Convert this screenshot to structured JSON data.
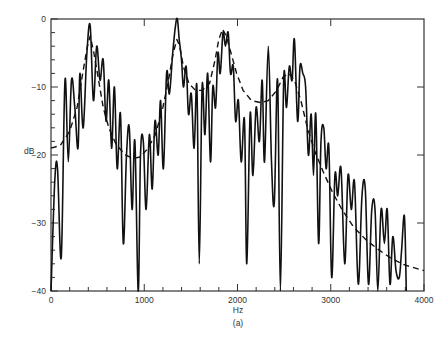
{
  "chart_data": {
    "type": "line",
    "title": "",
    "caption": "(a)",
    "xlabel": "Hz",
    "ylabel": "dB",
    "xlim": [
      0,
      4000
    ],
    "ylim": [
      -40,
      0
    ],
    "x_ticks_major": [
      0,
      1000,
      2000,
      3000,
      4000
    ],
    "x_tick_labels": [
      "0",
      "1000",
      "2000",
      "3000",
      "4000"
    ],
    "x_ticks_minor_step": 200,
    "y_ticks_major": [
      0,
      -10,
      -20,
      -30,
      -40
    ],
    "y_tick_labels": [
      "0",
      "−10",
      "−20",
      "−30",
      "−40"
    ],
    "y_ticks_minor_step": 2,
    "grid": false,
    "legend": "none",
    "series": [
      {
        "name": "Harmonic spectrum",
        "style": "solid",
        "color": "#111111",
        "points": [
          [
            0,
            -40
          ],
          [
            40,
            -24
          ],
          [
            70,
            -22
          ],
          [
            110,
            -35
          ],
          [
            150,
            -9
          ],
          [
            185,
            -21
          ],
          [
            220,
            -9
          ],
          [
            255,
            -13
          ],
          [
            290,
            -19
          ],
          [
            310,
            -8
          ],
          [
            345,
            -16
          ],
          [
            385,
            -5
          ],
          [
            420,
            -1
          ],
          [
            455,
            -12
          ],
          [
            490,
            -4
          ],
          [
            525,
            -9
          ],
          [
            560,
            -6
          ],
          [
            590,
            -15
          ],
          [
            620,
            -9
          ],
          [
            650,
            -19
          ],
          [
            680,
            -10
          ],
          [
            710,
            -22
          ],
          [
            745,
            -14
          ],
          [
            775,
            -33
          ],
          [
            810,
            -20
          ],
          [
            840,
            -16
          ],
          [
            870,
            -28
          ],
          [
            900,
            -18
          ],
          [
            935,
            -40
          ],
          [
            960,
            -20
          ],
          [
            990,
            -18
          ],
          [
            1020,
            -28
          ],
          [
            1055,
            -17
          ],
          [
            1085,
            -25
          ],
          [
            1115,
            -15
          ],
          [
            1150,
            -20
          ],
          [
            1175,
            -12
          ],
          [
            1205,
            -22
          ],
          [
            1240,
            -8
          ],
          [
            1270,
            -11
          ],
          [
            1305,
            -5
          ],
          [
            1335,
            -1
          ],
          [
            1355,
            0
          ],
          [
            1375,
            -3
          ],
          [
            1400,
            -6
          ],
          [
            1420,
            -10
          ],
          [
            1450,
            -7
          ],
          [
            1475,
            -14
          ],
          [
            1505,
            -11
          ],
          [
            1535,
            -19
          ],
          [
            1565,
            -10
          ],
          [
            1590,
            -36
          ],
          [
            1620,
            -10
          ],
          [
            1650,
            -17
          ],
          [
            1680,
            -8
          ],
          [
            1710,
            -21
          ],
          [
            1735,
            -10
          ],
          [
            1765,
            -13
          ],
          [
            1790,
            -5
          ],
          [
            1815,
            -8
          ],
          [
            1845,
            -2
          ],
          [
            1870,
            -4
          ],
          [
            1900,
            -2
          ],
          [
            1925,
            -8
          ],
          [
            1955,
            -7
          ],
          [
            1980,
            -15
          ],
          [
            2010,
            -12
          ],
          [
            2040,
            -21
          ],
          [
            2075,
            -15
          ],
          [
            2100,
            -36
          ],
          [
            2135,
            -14
          ],
          [
            2165,
            -23
          ],
          [
            2200,
            -13
          ],
          [
            2235,
            -18
          ],
          [
            2265,
            -9
          ],
          [
            2290,
            -21
          ],
          [
            2330,
            -4
          ],
          [
            2365,
            -21
          ],
          [
            2395,
            -27
          ],
          [
            2430,
            -9
          ],
          [
            2460,
            -40
          ],
          [
            2495,
            -9
          ],
          [
            2525,
            -13
          ],
          [
            2555,
            -7
          ],
          [
            2585,
            -9
          ],
          [
            2610,
            -3
          ],
          [
            2645,
            -15
          ],
          [
            2670,
            -7
          ],
          [
            2700,
            -8
          ],
          [
            2730,
            -10
          ],
          [
            2760,
            -20
          ],
          [
            2790,
            -14
          ],
          [
            2815,
            -23
          ],
          [
            2840,
            -14
          ],
          [
            2870,
            -33
          ],
          [
            2895,
            -18
          ],
          [
            2925,
            -16
          ],
          [
            2950,
            -22
          ],
          [
            2980,
            -19
          ],
          [
            3010,
            -38
          ],
          [
            3045,
            -23
          ],
          [
            3075,
            -26
          ],
          [
            3110,
            -22
          ],
          [
            3150,
            -36
          ],
          [
            3185,
            -23
          ],
          [
            3220,
            -28
          ],
          [
            3255,
            -24
          ],
          [
            3295,
            -39
          ],
          [
            3335,
            -26
          ],
          [
            3370,
            -25
          ],
          [
            3405,
            -39
          ],
          [
            3440,
            -28
          ],
          [
            3475,
            -28
          ],
          [
            3505,
            -40
          ],
          [
            3540,
            -28
          ],
          [
            3575,
            -33
          ],
          [
            3605,
            -28
          ],
          [
            3635,
            -39
          ],
          [
            3665,
            -32
          ],
          [
            3700,
            -37
          ],
          [
            3735,
            -38
          ],
          [
            3760,
            -34
          ],
          [
            3790,
            -29
          ],
          [
            3810,
            -40
          ]
        ]
      },
      {
        "name": "Spectral envelope",
        "style": "dashed",
        "color": "#111111",
        "points": [
          [
            0,
            -19
          ],
          [
            100,
            -18.6
          ],
          [
            200,
            -16.5
          ],
          [
            280,
            -13
          ],
          [
            340,
            -8
          ],
          [
            390,
            -4
          ],
          [
            420,
            -2.5
          ],
          [
            460,
            -5
          ],
          [
            510,
            -9
          ],
          [
            560,
            -13
          ],
          [
            620,
            -16
          ],
          [
            700,
            -18.5
          ],
          [
            800,
            -20
          ],
          [
            880,
            -20.5
          ],
          [
            960,
            -20.3
          ],
          [
            1040,
            -19
          ],
          [
            1120,
            -17
          ],
          [
            1200,
            -13
          ],
          [
            1260,
            -9
          ],
          [
            1310,
            -5
          ],
          [
            1350,
            -3
          ],
          [
            1380,
            -4
          ],
          [
            1420,
            -7
          ],
          [
            1480,
            -9.5
          ],
          [
            1550,
            -10.5
          ],
          [
            1620,
            -10.5
          ],
          [
            1700,
            -9.5
          ],
          [
            1760,
            -6
          ],
          [
            1800,
            -3
          ],
          [
            1840,
            -1.5
          ],
          [
            1880,
            -2.5
          ],
          [
            1930,
            -5
          ],
          [
            1990,
            -8
          ],
          [
            2060,
            -10.5
          ],
          [
            2150,
            -12
          ],
          [
            2250,
            -12.3
          ],
          [
            2330,
            -12
          ],
          [
            2420,
            -10.5
          ],
          [
            2490,
            -8.5
          ],
          [
            2550,
            -8
          ],
          [
            2610,
            -9
          ],
          [
            2680,
            -12
          ],
          [
            2750,
            -16
          ],
          [
            2830,
            -19.5
          ],
          [
            2920,
            -22.5
          ],
          [
            3020,
            -25.5
          ],
          [
            3120,
            -28
          ],
          [
            3240,
            -30.5
          ],
          [
            3380,
            -32.5
          ],
          [
            3520,
            -34
          ],
          [
            3660,
            -35.3
          ],
          [
            3800,
            -36.2
          ],
          [
            4000,
            -37
          ]
        ]
      }
    ],
    "annotations": [
      "(a)"
    ]
  },
  "layout": {
    "plot_left": 51,
    "plot_right": 424,
    "plot_top": 19,
    "plot_bottom": 291
  }
}
